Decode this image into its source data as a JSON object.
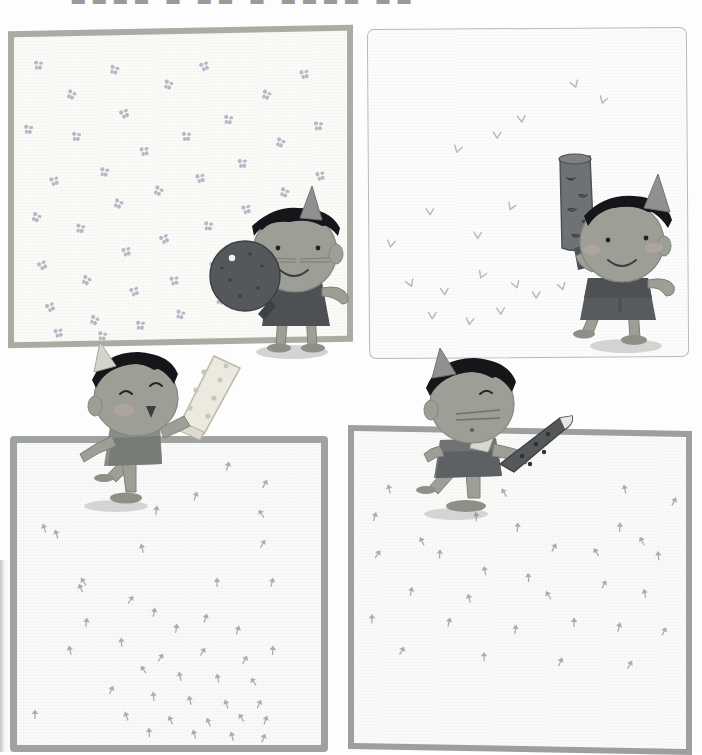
{
  "page": {
    "kind": "scanned-picture-book-page",
    "width": 702,
    "height": 752,
    "background_color": "#fdfdfd",
    "cropped_top_text": "■■■■ ■ ■■ ■ ■■■■ ■■"
  },
  "palette": {
    "paper": "#fbfbf8",
    "border_green_gray": "#a8aca2",
    "border_gray": "#9fa3a0",
    "border_thin": "#b8bcb8",
    "skin": "#9d9f96",
    "skin_shade": "#8d9087",
    "hair_black": "#15151a",
    "hat_gray": "#8e9190",
    "dress_dark": "#4e5153",
    "dress_mid": "#6f7375",
    "cheek": "#b5a7a2",
    "object_dark": "#55585b",
    "object_light": "#eceade",
    "motif_violet": "#b9b7c6",
    "motif_bird": "#b6bbbc",
    "motif_tree": "#a9aeab",
    "shadow": "rgba(120,125,120,0.30)"
  },
  "panels": [
    {
      "id": "panel-1",
      "position": "top-left",
      "border_style": "straight thick gray-green frame",
      "background_motif": "four-petal flower",
      "motif_color": "#b9b7c6",
      "motif_count": 46,
      "character": {
        "name": "child-with-round-object",
        "pose": "standing, facing left, holding large round dark object",
        "hat": "cone hat",
        "hair": "black bowl-cut",
        "expression": "smiling, whiskers",
        "held_object": "round dark disc with handle",
        "held_object_color": "#55585b"
      }
    },
    {
      "id": "panel-2",
      "position": "top-right",
      "border_style": "thin wavy hand-drawn outline",
      "background_motif": "small bird V mark",
      "motif_color": "#b6bbbc",
      "motif_count": 21,
      "character": {
        "name": "child-with-raised-cylinder",
        "pose": "standing, facing right, holding tall cylinder overhead",
        "hat": "cone hat",
        "hair": "black bowl-cut",
        "expression": "smiling with round cheeks",
        "held_object": "tall dark cylinder on handle",
        "held_object_color": "#55585b"
      }
    },
    {
      "id": "panel-3",
      "position": "bottom-left",
      "border_style": "thick wavy gray frame",
      "background_motif": "small sprout",
      "motif_color": "#a9aeab",
      "motif_count": 44,
      "character": {
        "name": "child-with-light-bar",
        "pose": "leaning forward over panel edge, arm raised",
        "hat": "cone hat",
        "hair": "black bowl-cut",
        "expression": "eyes closed, open mouth",
        "held_object": "long pale speckled bar",
        "held_object_color": "#eceade"
      }
    },
    {
      "id": "panel-4",
      "position": "bottom-right",
      "border_style": "thick straight gray frame",
      "background_motif": "small sprout",
      "motif_color": "#a9aeab",
      "motif_count": 32,
      "character": {
        "name": "child-with-dark-blade",
        "pose": "crouching over panel edge, holding dark pointed object",
        "hat": "cone hat",
        "hair": "black bowl-cut",
        "expression": "closed eyes, whiskers",
        "held_object": "dark elongated pointed object",
        "held_object_color": "#55585b"
      }
    }
  ],
  "motif_positions": {
    "panel1_flowers": [
      [
        20,
        24
      ],
      [
        53,
        54
      ],
      [
        96,
        30
      ],
      [
        10,
        88
      ],
      [
        58,
        96
      ],
      [
        106,
        74
      ],
      [
        150,
        46
      ],
      [
        186,
        28
      ],
      [
        36,
        140
      ],
      [
        86,
        132
      ],
      [
        126,
        112
      ],
      [
        168,
        98
      ],
      [
        210,
        82
      ],
      [
        248,
        58
      ],
      [
        286,
        38
      ],
      [
        18,
        176
      ],
      [
        62,
        188
      ],
      [
        100,
        164
      ],
      [
        140,
        152
      ],
      [
        182,
        140
      ],
      [
        224,
        126
      ],
      [
        262,
        106
      ],
      [
        300,
        90
      ],
      [
        24,
        224
      ],
      [
        68,
        240
      ],
      [
        108,
        212
      ],
      [
        146,
        200
      ],
      [
        190,
        188
      ],
      [
        228,
        172
      ],
      [
        266,
        156
      ],
      [
        302,
        140
      ],
      [
        32,
        266
      ],
      [
        76,
        280
      ],
      [
        116,
        252
      ],
      [
        156,
        242
      ],
      [
        196,
        228
      ],
      [
        234,
        214
      ],
      [
        272,
        200
      ],
      [
        40,
        292
      ],
      [
        84,
        296
      ],
      [
        122,
        286
      ],
      [
        162,
        276
      ],
      [
        202,
        262
      ],
      [
        240,
        250
      ],
      [
        276,
        236
      ],
      [
        306,
        220
      ]
    ],
    "panel2_birds": [
      [
        86,
        110
      ],
      [
        124,
        96
      ],
      [
        148,
        80
      ],
      [
        200,
        46
      ],
      [
        232,
        62
      ],
      [
        56,
        172
      ],
      [
        140,
        168
      ],
      [
        196,
        160
      ],
      [
        18,
        204
      ],
      [
        104,
        196
      ],
      [
        34,
        244
      ],
      [
        70,
        252
      ],
      [
        110,
        236
      ],
      [
        140,
        246
      ],
      [
        162,
        256
      ],
      [
        186,
        248
      ],
      [
        58,
        276
      ],
      [
        96,
        282
      ],
      [
        126,
        272
      ],
      [
        218,
        268
      ],
      [
        250,
        276
      ]
    ],
    "panel3_trees": [
      [
        208,
        14
      ],
      [
        246,
        32
      ],
      [
        176,
        44
      ],
      [
        136,
        58
      ],
      [
        238,
        62
      ],
      [
        22,
        76
      ],
      [
        34,
        82
      ],
      [
        120,
        96
      ],
      [
        244,
        92
      ],
      [
        60,
        130
      ],
      [
        58,
        136
      ],
      [
        196,
        130
      ],
      [
        252,
        130
      ],
      [
        112,
        148
      ],
      [
        134,
        160
      ],
      [
        66,
        170
      ],
      [
        156,
        176
      ],
      [
        186,
        166
      ],
      [
        218,
        178
      ],
      [
        100,
        190
      ],
      [
        48,
        198
      ],
      [
        142,
        206
      ],
      [
        184,
        200
      ],
      [
        226,
        208
      ],
      [
        252,
        198
      ],
      [
        120,
        218
      ],
      [
        158,
        224
      ],
      [
        196,
        226
      ],
      [
        230,
        230
      ],
      [
        92,
        238
      ],
      [
        132,
        244
      ],
      [
        168,
        248
      ],
      [
        204,
        252
      ],
      [
        240,
        252
      ],
      [
        14,
        262
      ],
      [
        104,
        264
      ],
      [
        148,
        268
      ],
      [
        186,
        270
      ],
      [
        218,
        266
      ],
      [
        246,
        268
      ],
      [
        128,
        280
      ],
      [
        172,
        282
      ],
      [
        210,
        284
      ],
      [
        244,
        286
      ]
    ],
    "panel4_trees": [
      [
        30,
        48
      ],
      [
        144,
        50
      ],
      [
        266,
        44
      ],
      [
        318,
        56
      ],
      [
        18,
        76
      ],
      [
        118,
        74
      ],
      [
        262,
        82
      ],
      [
        282,
        96
      ],
      [
        62,
        100
      ],
      [
        160,
        84
      ],
      [
        22,
        114
      ],
      [
        82,
        112
      ],
      [
        198,
        104
      ],
      [
        236,
        108
      ],
      [
        300,
        110
      ],
      [
        126,
        128
      ],
      [
        170,
        134
      ],
      [
        248,
        140
      ],
      [
        54,
        150
      ],
      [
        110,
        156
      ],
      [
        188,
        152
      ],
      [
        286,
        148
      ],
      [
        14,
        178
      ],
      [
        92,
        180
      ],
      [
        158,
        186
      ],
      [
        216,
        178
      ],
      [
        262,
        182
      ],
      [
        308,
        186
      ],
      [
        46,
        210
      ],
      [
        126,
        214
      ],
      [
        204,
        218
      ],
      [
        274,
        220
      ]
    ]
  }
}
